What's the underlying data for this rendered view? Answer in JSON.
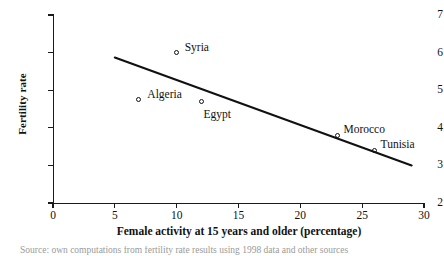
{
  "chart_data": {
    "type": "scatter",
    "title": "",
    "xlabel": "Female activity at 15 years and older (percentage)",
    "ylabel": "Fertility rate",
    "xlim": [
      0,
      30
    ],
    "ylim": [
      2,
      7
    ],
    "xticks": [
      0,
      5,
      10,
      15,
      20,
      25,
      30
    ],
    "yticks": [
      2,
      3,
      4,
      5,
      6,
      7
    ],
    "grid": false,
    "legend": "none",
    "points": [
      {
        "label": "Syria",
        "x": 10,
        "y": 6.0,
        "label_dx": 8,
        "label_dy": -11
      },
      {
        "label": "Algeria",
        "x": 6.9,
        "y": 4.75,
        "label_dx": 9,
        "label_dy": -11
      },
      {
        "label": "Egypt",
        "x": 12,
        "y": 4.7,
        "label_dx": 2,
        "label_dy": 8
      },
      {
        "label": "Morocco",
        "x": 23,
        "y": 3.8,
        "label_dx": 6,
        "label_dy": -11
      },
      {
        "label": "Tunisia",
        "x": 26,
        "y": 3.4,
        "label_dx": 6,
        "label_dy": -11
      }
    ],
    "trendline": {
      "name": "linear fit",
      "x_start": 5.0,
      "y_start": 5.87,
      "x_end": 29.0,
      "y_end": 3.0
    }
  },
  "caption": {
    "text": "Source: own computations from fertility rate results using 1998 data and other sources"
  },
  "colors": {
    "ink": "#111111",
    "background": "#ffffff",
    "caption": "#9a9a9a"
  }
}
